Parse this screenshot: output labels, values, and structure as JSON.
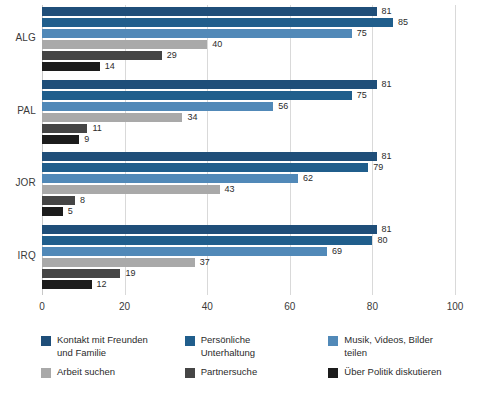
{
  "chart_data": {
    "type": "bar",
    "orientation": "horizontal",
    "title": "",
    "subtitle": "",
    "xlabel": "",
    "ylabel": "",
    "xlim": [
      0,
      100
    ],
    "xticks": [
      0,
      20,
      40,
      60,
      80,
      100
    ],
    "xtick_labels": [
      "0",
      "20",
      "40",
      "60",
      "80",
      "100"
    ],
    "grid": "vertical",
    "legend_position": "bottom",
    "legend_columns": 3,
    "categories": [
      "ALG",
      "PAL",
      "JOR",
      "IRQ"
    ],
    "series": [
      {
        "name": "Kontakt mit Freunden und Familie",
        "color": "#1F4E79",
        "values": [
          81,
          81,
          81,
          81
        ]
      },
      {
        "name": "Persönliche Unterhaltung",
        "color": "#205E8C",
        "values": [
          85,
          75,
          79,
          80
        ]
      },
      {
        "name": "Musik, Videos, Bilder teilen",
        "color": "#5189B8",
        "values": [
          75,
          56,
          62,
          69
        ]
      },
      {
        "name": "Arbeit suchen",
        "color": "#A9A9A9",
        "values": [
          40,
          34,
          43,
          37
        ]
      },
      {
        "name": "Partnersuche",
        "color": "#454545",
        "values": [
          29,
          11,
          8,
          19
        ]
      },
      {
        "name": "Über Politik diskutieren",
        "color": "#1C1C1C",
        "values": [
          14,
          9,
          5,
          12
        ]
      }
    ]
  },
  "legend": {
    "items": [
      {
        "label": "Kontakt mit Freunden\nund Familie",
        "color": "#1F4E79",
        "icon": "legend-swatch"
      },
      {
        "label": "Persönliche\nUnterhaltung",
        "color": "#205E8C",
        "icon": "legend-swatch"
      },
      {
        "label": "Musik, Videos, Bilder\nteilen",
        "color": "#5189B8",
        "icon": "legend-swatch"
      },
      {
        "label": "Arbeit suchen",
        "color": "#A9A9A9",
        "icon": "legend-swatch"
      },
      {
        "label": "Partnersuche",
        "color": "#454545",
        "icon": "legend-swatch"
      },
      {
        "label": "Über Politik diskutieren",
        "color": "#1C1C1C",
        "icon": "legend-swatch"
      }
    ]
  },
  "colors": {
    "gridline": "#d9d9d9",
    "axis_text": "#3a3a3a",
    "label_text": "#2b2b2b",
    "background": "#ffffff"
  }
}
